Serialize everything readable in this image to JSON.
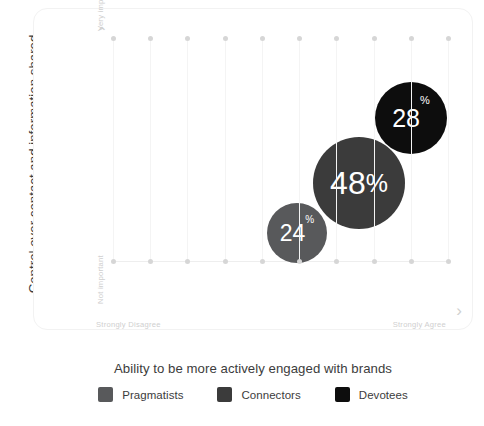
{
  "axes": {
    "y_title": "Control over contact and information shared",
    "x_title": "Ability to be more actively engaged with brands",
    "y_top_label": "Very important",
    "y_bottom_label": "Not important",
    "x_left_label": "Strongly Disagree",
    "x_right_label": "Strongly Agree",
    "y_arrow": "⌃",
    "x_arrow": "›"
  },
  "legend": {
    "items": [
      {
        "label": "Pragmatists",
        "color": "#58595b"
      },
      {
        "label": "Connectors",
        "color": "#3b3b3b"
      },
      {
        "label": "Devotees",
        "color": "#0d0d0d"
      }
    ]
  },
  "bubbles": [
    {
      "series": "Pragmatists",
      "value": "24",
      "pct": "%",
      "color": "#58595b"
    },
    {
      "series": "Connectors",
      "value": "48",
      "pct": "%",
      "color": "#3b3b3b"
    },
    {
      "series": "Devotees",
      "value": "28",
      "pct": "%",
      "color": "#0d0d0d"
    }
  ],
  "chart_data": {
    "type": "scatter",
    "title": "",
    "xlabel": "Ability to be more actively engaged with brands",
    "ylabel": "Control over contact and information shared",
    "xlim": [
      0,
      10
    ],
    "ylim": [
      0,
      10
    ],
    "x_tick_labels": [
      "Strongly Disagree",
      "",
      "",
      "",
      "",
      "",
      "",
      "",
      "",
      "Strongly Agree"
    ],
    "y_tick_labels": [
      "Not important",
      "Very important"
    ],
    "grid": true,
    "grid_orientation": "vertical",
    "gridline_count": 10,
    "legend_position": "bottom-center",
    "series": [
      {
        "name": "Pragmatists",
        "x": 4.3,
        "y": 3.9,
        "size": 24,
        "label": "24%",
        "color": "#58595b"
      },
      {
        "name": "Connectors",
        "x": 6.0,
        "y": 5.8,
        "size": 48,
        "label": "48%",
        "color": "#3b3b3b"
      },
      {
        "name": "Devotees",
        "x": 7.4,
        "y": 7.8,
        "size": 28,
        "label": "28%",
        "color": "#0d0d0d"
      }
    ]
  }
}
